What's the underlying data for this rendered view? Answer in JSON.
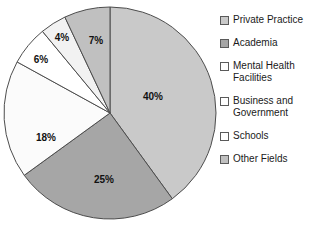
{
  "chart_data": {
    "type": "pie",
    "title": "",
    "subtitle": "",
    "xlabel": "",
    "ylabel": "",
    "legend_position": "right",
    "grid": false,
    "start_angle_deg": 0,
    "direction": "clockwise",
    "categories": [
      "Private Practice",
      "Academia",
      "Mental Health Facilities",
      "Business and Government",
      "Schools",
      "Other Fields"
    ],
    "values": [
      40,
      25,
      18,
      6,
      4,
      7
    ],
    "data_labels": [
      "40%",
      "25%",
      "18%",
      "6%",
      "4%",
      "7%"
    ],
    "colors": [
      "#c9c9c9",
      "#a6a6a6",
      "#fbfbfb",
      "#ffffff",
      "#f2f2f2",
      "#c0c0c0"
    ],
    "slice_border_color": "#4d4d4d",
    "units": "percent"
  },
  "pie": {
    "center_x": 110,
    "center_y": 113,
    "radius": 106,
    "slices": [
      {
        "label": "40%",
        "value": 40,
        "color": "#c9c9c9",
        "label_x": 153,
        "label_y": 97
      },
      {
        "label": "25%",
        "value": 25,
        "color": "#a6a6a6",
        "label_x": 104,
        "label_y": 180
      },
      {
        "label": "18%",
        "value": 18,
        "color": "#fbfbfb",
        "label_x": 46,
        "label_y": 138
      },
      {
        "label": "6%",
        "value": 6,
        "color": "#ffffff",
        "label_x": 41,
        "label_y": 60
      },
      {
        "label": "4%",
        "value": 4,
        "color": "#f2f2f2",
        "label_x": 62,
        "label_y": 38
      },
      {
        "label": "7%",
        "value": 7,
        "color": "#c0c0c0",
        "label_x": 96,
        "label_y": 41
      }
    ]
  },
  "legend": {
    "items": [
      {
        "label": "Private Practice",
        "color": "#c9c9c9"
      },
      {
        "label": "Academia",
        "color": "#a6a6a6"
      },
      {
        "label": "Mental Health\nFacilities",
        "color": "#fdfdfd"
      },
      {
        "label": "Business and\nGovernment",
        "color": "#ffffff"
      },
      {
        "label": "Schools",
        "color": "#ffffff"
      },
      {
        "label": "Other Fields",
        "color": "#c0c0c0"
      }
    ]
  }
}
